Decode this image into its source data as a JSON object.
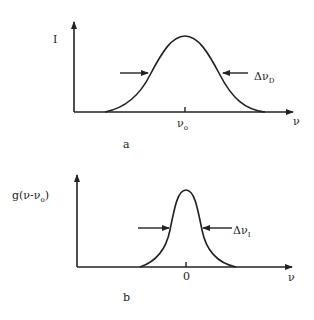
{
  "panel_a": {
    "caption": "a",
    "y_label": "I",
    "x_label": "ν",
    "tick_label": "ν",
    "tick_label_sub": "o",
    "width_label": "Δν",
    "width_label_sub": "D",
    "curve": "Gaussian (Doppler-broadened line)"
  },
  "panel_b": {
    "caption": "b",
    "y_label_main": "g(ν-ν",
    "y_label_sub": "o",
    "y_label_close": ")",
    "x_label": "ν",
    "tick_label": "0",
    "width_label": "Δν",
    "width_label_sub": "I",
    "curve": "narrow intrinsic line shape"
  },
  "colors": {
    "ink": "#222222",
    "background": "#ffffff"
  }
}
